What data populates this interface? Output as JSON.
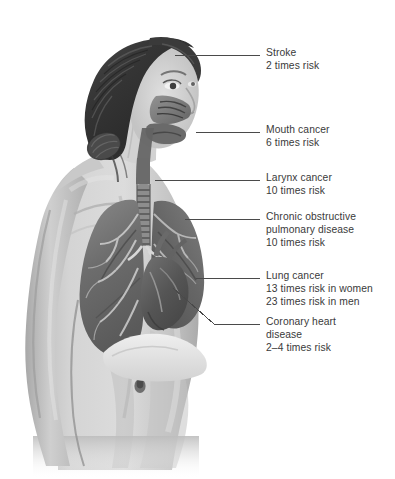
{
  "illustration": {
    "subject": "female figure, three-quarter rear view, head turned to the right",
    "style": "grayscale medical anatomical cutaway",
    "visible_anatomy": [
      "hair",
      "face",
      "nasal cavity",
      "oral cavity",
      "larynx",
      "trachea",
      "left lung",
      "right lung",
      "bronchial tree",
      "heart",
      "diaphragm",
      "shoulder",
      "arm",
      "back",
      "navel",
      "hip"
    ],
    "background_color": "#ffffff",
    "skin_tone": "#cfcfcf",
    "hair_color": "#3b3b3b",
    "lung_color": "#6e6e6e",
    "heart_color": "#595959",
    "leader_line_color": "#4a4a4a",
    "text_color": "#3a3a3a"
  },
  "callouts": [
    {
      "id": "stroke",
      "name": "Stroke",
      "lines": [
        "Stroke",
        "2 times risk"
      ],
      "risk": "2 times risk",
      "leader": {
        "x1": 175,
        "y1": 55,
        "x2": 260,
        "y2": 55,
        "type": "straight"
      },
      "text_x": 266,
      "text_y": 47
    },
    {
      "id": "mouth-cancer",
      "name": "Mouth cancer",
      "lines": [
        "Mouth cancer",
        "6 times risk"
      ],
      "risk": "6 times risk",
      "leader": {
        "x1": 196,
        "y1": 132,
        "x2": 260,
        "y2": 132,
        "type": "straight"
      },
      "text_x": 266,
      "text_y": 124
    },
    {
      "id": "larynx-cancer",
      "name": "Larynx cancer",
      "lines": [
        "Larynx cancer",
        "10 times risk"
      ],
      "risk": "10 times risk",
      "leader": {
        "x1": 155,
        "y1": 180,
        "x2": 260,
        "y2": 180,
        "type": "straight"
      },
      "text_x": 266,
      "text_y": 172
    },
    {
      "id": "copd",
      "name": "Chronic obstructive pulmonary disease",
      "lines": [
        "Chronic obstructive",
        "pulmonary disease",
        "10 times risk"
      ],
      "risk": "10 times risk",
      "leader": {
        "x1": 185,
        "y1": 219,
        "x2": 260,
        "y2": 219,
        "type": "straight"
      },
      "text_x": 266,
      "text_y": 211
    },
    {
      "id": "lung-cancer",
      "name": "Lung cancer",
      "lines": [
        "Lung cancer",
        "13 times risk in women",
        "23 times risk in men"
      ],
      "risk_women": "13 times risk in women",
      "risk_men": "23 times risk in men",
      "leader": {
        "x1": 196,
        "y1": 278,
        "x2": 260,
        "y2": 278,
        "type": "straight"
      },
      "text_x": 266,
      "text_y": 270
    },
    {
      "id": "coronary-heart-disease",
      "name": "Coronary heart disease",
      "lines": [
        "Coronary heart",
        "disease",
        "2–4 times risk"
      ],
      "risk": "2–4 times risk",
      "leader": {
        "x1": 173,
        "y1": 288,
        "x2": 260,
        "y2": 324,
        "type": "elbow",
        "bend_x": 214,
        "bend_y": 324
      },
      "text_x": 266,
      "text_y": 316
    }
  ]
}
